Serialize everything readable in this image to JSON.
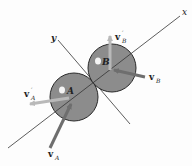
{
  "diagram": {
    "axes": {
      "x_label": "x",
      "y_label": "y"
    },
    "bodies": [
      {
        "name": "A",
        "label": "A"
      },
      {
        "name": "B",
        "label": "B"
      }
    ],
    "vectors": [
      {
        "name": "v_A",
        "symbol": "v",
        "subscript": "A",
        "prime": "",
        "kind": "initial"
      },
      {
        "name": "v_B",
        "symbol": "v",
        "subscript": "B",
        "prime": "",
        "kind": "initial"
      },
      {
        "name": "v_A_prime",
        "symbol": "v",
        "subscript": "A",
        "prime": "′",
        "kind": "final"
      },
      {
        "name": "v_B_prime",
        "symbol": "v",
        "subscript": "B",
        "prime": "′",
        "kind": "final"
      }
    ],
    "colors": {
      "sphere_fill": "#8c8c8c",
      "sphere_stroke": "#2a2a2a",
      "initial_arrow": "#6e6e6e",
      "final_arrow": "#b9b9b9",
      "line": "#333333",
      "highlight": "#f4f4f4"
    }
  }
}
